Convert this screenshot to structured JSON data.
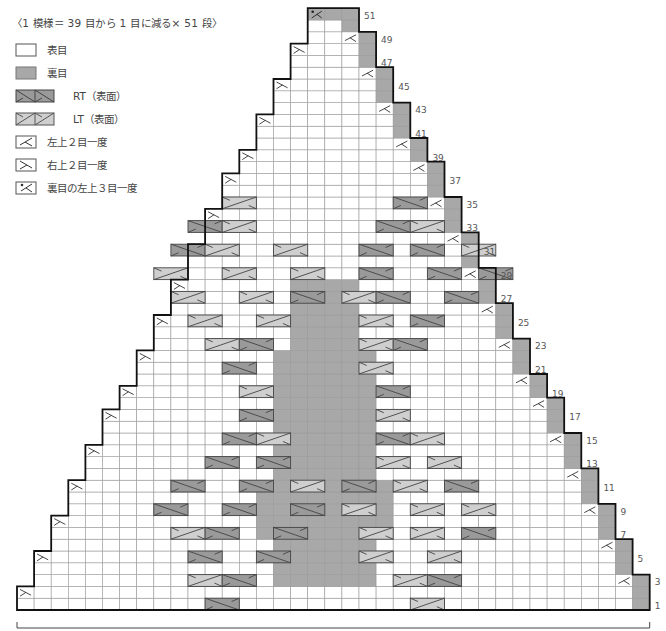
{
  "title": "〈1 模様＝ 39 目から 1 目に減る× 51 段〉",
  "legend": [
    {
      "symbol": "knit",
      "label": "表目"
    },
    {
      "symbol": "purl",
      "label": "裏目"
    },
    {
      "symbol": "rt",
      "label": "RT（表面）"
    },
    {
      "symbol": "lt",
      "label": "LT（表面）"
    },
    {
      "symbol": "k2tog",
      "label": "左上２目一度"
    },
    {
      "symbol": "ssk",
      "label": "右上２目一度"
    },
    {
      "symbol": "p3tog",
      "label": "裏目の左上３目一度"
    }
  ],
  "colors": {
    "purl": "#a8a8a8",
    "rt": "#9a9a9a",
    "lt": "#cfcfcf",
    "grid": "#9a9a9a",
    "outline": "#111111"
  },
  "chart": {
    "rows": 51,
    "cols": 37,
    "origin_x": 17,
    "bottom_y": 610,
    "col_w": 17.1,
    "row_h": 11.8,
    "row_labels": [
      "1",
      "3",
      "5",
      "7",
      "9",
      "11",
      "13",
      "15",
      "17",
      "19",
      "21",
      "23",
      "25",
      "27",
      "29",
      "31",
      "33",
      "35",
      "37",
      "39",
      "41",
      "43",
      "45",
      "47",
      "49",
      "51"
    ],
    "center_purl": [
      {
        "from_row": 23,
        "to_row": 28,
        "c0": 16,
        "c1": 19
      },
      {
        "from_row": 12,
        "to_row": 22,
        "c0": 15,
        "c1": 20
      },
      {
        "from_row": 7,
        "to_row": 11,
        "c0": 14,
        "c1": 21
      },
      {
        "from_row": 3,
        "to_row": 6,
        "c0": 15,
        "c1": 20
      }
    ],
    "cables": [
      [
        1,
        11,
        "rt"
      ],
      [
        1,
        23,
        "lt"
      ],
      [
        3,
        10,
        "lt"
      ],
      [
        3,
        12,
        "rt"
      ],
      [
        3,
        22,
        "lt"
      ],
      [
        3,
        24,
        "rt"
      ],
      [
        5,
        10,
        "rt"
      ],
      [
        5,
        14,
        "rt"
      ],
      [
        5,
        20,
        "lt"
      ],
      [
        5,
        24,
        "lt"
      ],
      [
        7,
        9,
        "lt"
      ],
      [
        7,
        11,
        "rt"
      ],
      [
        7,
        15,
        "rt"
      ],
      [
        7,
        20,
        "lt"
      ],
      [
        7,
        23,
        "lt"
      ],
      [
        7,
        26,
        "rt"
      ],
      [
        9,
        8,
        "rt"
      ],
      [
        9,
        12,
        "rt"
      ],
      [
        9,
        16,
        "rt"
      ],
      [
        9,
        19,
        "lt"
      ],
      [
        9,
        23,
        "lt"
      ],
      [
        9,
        26,
        "lt"
      ],
      [
        11,
        9,
        "rt"
      ],
      [
        11,
        13,
        "rt"
      ],
      [
        11,
        16,
        "lt"
      ],
      [
        11,
        19,
        "rt"
      ],
      [
        11,
        22,
        "lt"
      ],
      [
        11,
        25,
        "rt"
      ],
      [
        13,
        11,
        "rt"
      ],
      [
        13,
        14,
        "rt"
      ],
      [
        13,
        21,
        "lt"
      ],
      [
        13,
        24,
        "lt"
      ],
      [
        15,
        12,
        "rt"
      ],
      [
        15,
        14,
        "lt"
      ],
      [
        15,
        21,
        "rt"
      ],
      [
        15,
        23,
        "lt"
      ],
      [
        17,
        13,
        "rt"
      ],
      [
        17,
        21,
        "lt"
      ],
      [
        19,
        13,
        "lt"
      ],
      [
        19,
        21,
        "rt"
      ],
      [
        21,
        12,
        "rt"
      ],
      [
        21,
        20,
        "lt"
      ],
      [
        23,
        11,
        "lt"
      ],
      [
        23,
        13,
        "rt"
      ],
      [
        23,
        20,
        "lt"
      ],
      [
        23,
        22,
        "rt"
      ],
      [
        25,
        10,
        "lt"
      ],
      [
        25,
        14,
        "lt"
      ],
      [
        25,
        20,
        "lt"
      ],
      [
        25,
        23,
        "rt"
      ],
      [
        27,
        9,
        "lt"
      ],
      [
        27,
        13,
        "lt"
      ],
      [
        27,
        16,
        "rt"
      ],
      [
        27,
        19,
        "lt"
      ],
      [
        27,
        21,
        "rt"
      ],
      [
        27,
        25,
        "rt"
      ],
      [
        29,
        8,
        "lt"
      ],
      [
        29,
        12,
        "lt"
      ],
      [
        29,
        16,
        "lt"
      ],
      [
        29,
        20,
        "rt"
      ],
      [
        29,
        24,
        "rt"
      ],
      [
        29,
        27,
        "rt"
      ],
      [
        31,
        9,
        "rt"
      ],
      [
        31,
        11,
        "lt"
      ],
      [
        31,
        15,
        "lt"
      ],
      [
        31,
        20,
        "rt"
      ],
      [
        31,
        23,
        "rt"
      ],
      [
        31,
        26,
        "lt"
      ],
      [
        33,
        10,
        "rt"
      ],
      [
        33,
        12,
        "lt"
      ],
      [
        33,
        21,
        "rt"
      ],
      [
        33,
        23,
        "lt"
      ],
      [
        35,
        12,
        "lt"
      ],
      [
        35,
        22,
        "rt"
      ]
    ]
  }
}
